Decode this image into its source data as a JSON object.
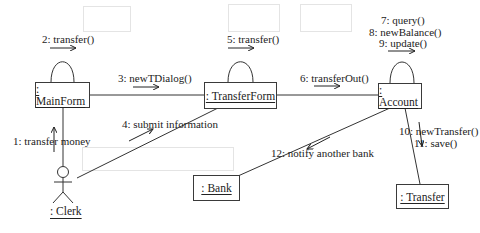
{
  "diagram": {
    "type": "UML communication diagram",
    "actors": [
      {
        "id": "clerk",
        "label": ": Clerk"
      }
    ],
    "objects": [
      {
        "id": "mainform",
        "label": ": MainForm"
      },
      {
        "id": "transferform",
        "label": ": TransferForm"
      },
      {
        "id": "account",
        "label": ": Account"
      },
      {
        "id": "bank",
        "label": ": Bank"
      },
      {
        "id": "transfer",
        "label": ": Transfer"
      }
    ],
    "messages": [
      {
        "seq": 1,
        "label": "1: transfer money",
        "from": "clerk",
        "to": "mainform"
      },
      {
        "seq": 2,
        "label": "2: transfer()",
        "from": "mainform",
        "to": "mainform"
      },
      {
        "seq": 3,
        "label": "3: newTDialog()",
        "from": "mainform",
        "to": "transferform"
      },
      {
        "seq": 4,
        "label": "4: submit information",
        "from": "clerk",
        "to": "transferform"
      },
      {
        "seq": 5,
        "label": "5: transfer()",
        "from": "transferform",
        "to": "transferform"
      },
      {
        "seq": 6,
        "label": "6: transferOut()",
        "from": "transferform",
        "to": "account"
      },
      {
        "seq": 7,
        "label": "7: query()",
        "from": "account",
        "to": "account"
      },
      {
        "seq": 8,
        "label": "8: newBalance()",
        "from": "account",
        "to": "account"
      },
      {
        "seq": 9,
        "label": "9: update()",
        "from": "account",
        "to": "account"
      },
      {
        "seq": 10,
        "label": "10: newTransfer()",
        "from": "account",
        "to": "transfer"
      },
      {
        "seq": 11,
        "label": "11: save()",
        "from": "account",
        "to": "transfer"
      },
      {
        "seq": 12,
        "label": "12: notify another bank",
        "from": "account",
        "to": "bank"
      }
    ]
  }
}
